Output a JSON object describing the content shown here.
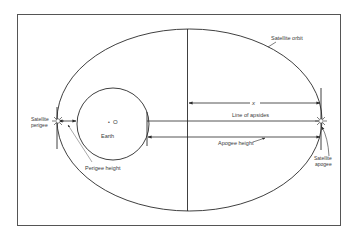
{
  "diagram": {
    "labels": {
      "satellite_orbit": "Satellite orbit",
      "x_label": "x",
      "line_of_apsides": "Line of apsides",
      "apogee_height": "Apogee height",
      "perigee_height": "Perigee height",
      "earth": "Earth",
      "center": "O",
      "satellite_perigee_line1": "Satellite",
      "satellite_perigee_line2": "perigee",
      "satellite_apogee_line1": "Satellite",
      "satellite_apogee_line2": "apogee"
    },
    "colors": {
      "stroke": "#2a2a2a",
      "text": "#3a3a3a",
      "background": "#ffffff"
    }
  }
}
